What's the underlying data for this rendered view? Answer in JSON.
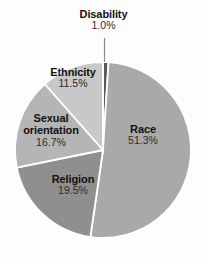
{
  "chart_data": {
    "type": "pie",
    "title": "",
    "subtitle": "",
    "xlabel": "",
    "ylabel": "",
    "legend_position": "none",
    "grid": false,
    "labels_inside_slices": true,
    "start_angle_deg": 0,
    "direction": "clockwise",
    "categories": [
      "Disability",
      "Race",
      "Religion",
      "Sexual orientation",
      "Ethnicity"
    ],
    "values": [
      1.0,
      51.3,
      19.5,
      16.7,
      11.5
    ],
    "value_suffix": "%",
    "slices": [
      {
        "label": "Disability",
        "label_line1": "Disability",
        "label_line2": "",
        "value": 1.0,
        "value_text": "1.0%",
        "color": "#595959",
        "label_placement": "outside-top",
        "has_leader_line": true
      },
      {
        "label": "Race",
        "label_line1": "Race",
        "label_line2": "",
        "value": 51.3,
        "value_text": "51.3%",
        "color": "#a9a9a9",
        "label_placement": "inside",
        "has_leader_line": false
      },
      {
        "label": "Religion",
        "label_line1": "Religion",
        "label_line2": "",
        "value": 19.5,
        "value_text": "19.5%",
        "color": "#8f8f8f",
        "label_placement": "inside",
        "has_leader_line": false
      },
      {
        "label": "Sexual orientation",
        "label_line1": "Sexual",
        "label_line2": "orientation",
        "value": 16.7,
        "value_text": "16.7%",
        "color": "#b5b5b5",
        "label_placement": "inside",
        "has_leader_line": false
      },
      {
        "label": "Ethnicity",
        "label_line1": "Ethnicity",
        "label_line2": "",
        "value": 11.5,
        "value_text": "11.5%",
        "color": "#c8c8c8",
        "label_placement": "inside",
        "has_leader_line": false
      }
    ],
    "style": {
      "background": "#fdfdfd",
      "separator_color": "#ffffff",
      "separator_width": 1.8,
      "leader_line_color": "#8a8a8a",
      "text_color": "#111111",
      "center_x": 103,
      "center_y": 150,
      "radius": 88
    }
  }
}
